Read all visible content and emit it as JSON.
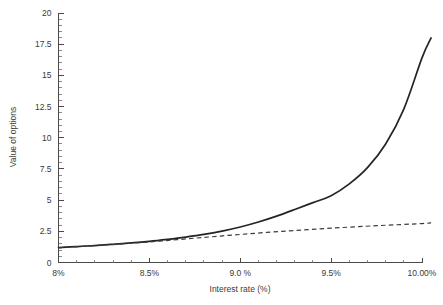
{
  "chart_data": {
    "type": "line",
    "title": "",
    "xlabel": "Interest rate (%)",
    "ylabel": "Value of options",
    "xlim": [
      8.0,
      10.0
    ],
    "ylim": [
      0,
      20
    ],
    "grid": false,
    "legend": "none",
    "x_tick_labels": [
      "8%",
      "8.5%",
      "9.0 %",
      "9.5%",
      "10.00%"
    ],
    "x_tick_values": [
      8.0,
      8.5,
      9.0,
      9.5,
      10.0
    ],
    "x_minor_tick_count_per_interval": 4,
    "y_tick_labels": [
      "0",
      "2.5",
      "5",
      "7.5",
      "10",
      "12.5",
      "15",
      "17.5",
      "20"
    ],
    "y_tick_values": [
      0,
      2.5,
      5,
      7.5,
      10,
      12.5,
      15,
      17.5,
      20
    ],
    "y_minor_tick_count_per_interval": 4,
    "series": [
      {
        "name": "solid-curve",
        "style": "solid",
        "color": "#242424",
        "x": [
          8.0,
          8.1,
          8.2,
          8.3,
          8.4,
          8.5,
          8.6,
          8.7,
          8.8,
          8.9,
          9.0,
          9.1,
          9.2,
          9.3,
          9.4,
          9.5,
          9.6,
          9.7,
          9.8,
          9.9,
          10.0,
          10.05
        ],
        "y": [
          1.2,
          1.28,
          1.36,
          1.46,
          1.57,
          1.7,
          1.86,
          2.04,
          2.25,
          2.52,
          2.85,
          3.25,
          3.72,
          4.25,
          4.8,
          5.35,
          6.3,
          7.6,
          9.5,
          12.3,
          16.4,
          18.0
        ]
      },
      {
        "name": "dashed-line",
        "style": "dashed",
        "color": "#3c3c3c",
        "x": [
          8.0,
          8.25,
          8.5,
          8.75,
          9.0,
          9.25,
          9.5,
          9.75,
          10.0,
          10.05
        ],
        "y": [
          1.18,
          1.4,
          1.65,
          1.95,
          2.25,
          2.52,
          2.75,
          2.95,
          3.12,
          3.18
        ]
      }
    ],
    "annotations": []
  }
}
